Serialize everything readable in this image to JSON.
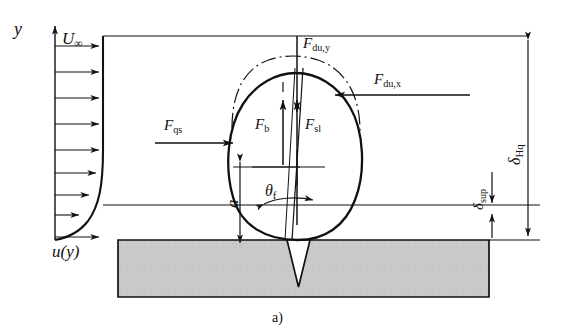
{
  "figure": {
    "caption": "a)",
    "axis": {
      "y_label": "y",
      "velocity_profile_label": "u(y)",
      "freestream_label": "U",
      "freestream_sub": "∞"
    },
    "forces": [
      {
        "name": "F-du-y",
        "base": "F",
        "sub": "du,y",
        "direction": "down",
        "desc": "unsteady drag vertical component"
      },
      {
        "name": "F-du-x",
        "base": "F",
        "sub": "du,x",
        "direction": "left",
        "desc": "unsteady drag horizontal component"
      },
      {
        "name": "F-qs",
        "base": "F",
        "sub": "qs",
        "direction": "right",
        "desc": "quasi-steady drag force"
      },
      {
        "name": "F-b",
        "base": "F",
        "sub": "b",
        "direction": "up",
        "desc": "buoyancy force"
      },
      {
        "name": "F-sl",
        "base": "F",
        "sub": "sl",
        "direction": "up",
        "desc": "shear lift force"
      }
    ],
    "dimensions": [
      {
        "name": "a",
        "base": "a",
        "sub": "",
        "desc": "bubble contact distance"
      },
      {
        "name": "delta-Hq",
        "base": "δ",
        "sub": "Hq",
        "desc": "thermal boundary layer thickness"
      },
      {
        "name": "delta-sup",
        "base": "δ",
        "sub": "sup",
        "desc": "superheated layer thickness"
      }
    ],
    "angles": [
      {
        "name": "theta-f",
        "base": "θ",
        "sub": "f",
        "desc": "bubble inclination angle"
      }
    ],
    "colors": {
      "line": "#111111",
      "substrate_fill": "#c9c9c9",
      "substrate_edge": "#111111",
      "background": "#ffffff"
    }
  }
}
